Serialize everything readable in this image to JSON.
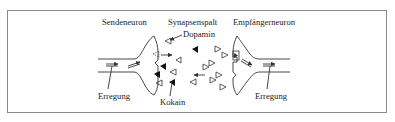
{
  "diagram": {
    "title_labels": {
      "sender": "Sendeneuron",
      "cleft": "Synapsenspalt",
      "receiver": "Empfängerneuron"
    },
    "annotations": {
      "dopamine": "Dopamin",
      "cocaine": "Kokain",
      "excitation_left": "Erregung",
      "excitation_right": "Erregung"
    },
    "legend": {
      "open_triangle": "Dopamin",
      "filled_triangle": "Kokain"
    },
    "colors": {
      "line": "#333333",
      "frame": "#8a8a8a",
      "background": "#ffffff",
      "filled": "#111111"
    }
  }
}
